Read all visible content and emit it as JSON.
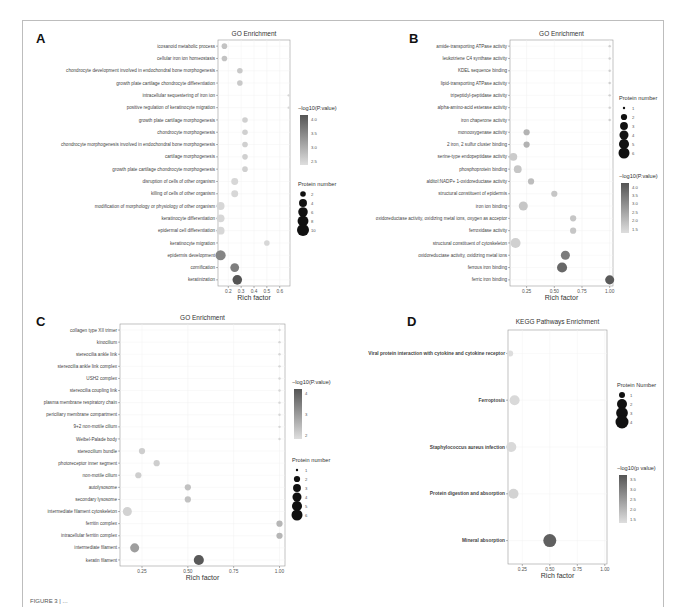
{
  "figure": {
    "caption_partial": "FIGURE 3 | ..."
  },
  "chart_data": [
    {
      "id": "A",
      "type": "scatter",
      "title": "GO Enrichment",
      "xlabel": "Rich factor",
      "ylabel": "",
      "xlim": [
        0.12,
        0.68
      ],
      "xticks": [
        0.2,
        0.3,
        0.4,
        0.5,
        0.6
      ],
      "xtick_labels": [
        "0.2",
        "0.3",
        "0.4",
        "0.5",
        "0.6"
      ],
      "grid": true,
      "legend_position": "right",
      "color_legend": {
        "title": "−log10(P.value)",
        "ticks": [
          "4.0",
          "3.5",
          "3.0",
          "2.5"
        ],
        "range": [
          2.2,
          4.2
        ]
      },
      "size_legend": {
        "title": "Protein number",
        "values": [
          2,
          4,
          6,
          8,
          10
        ]
      },
      "categories": [
        "icosanoid metabolic process",
        "cellular iron ion homeostasis",
        "chondrocyte development involved in endochondral bone morphogenesis",
        "growth plate cartilage chondrocyte differentiation",
        "intracellular sequestering of iron ion",
        "positive regulation of keratinocyte migration",
        "growth plate cartilage morphogenesis",
        "chondrocyte morphogenesis",
        "chondrocyte morphogenesis involved in endochondral bone morphogenesis",
        "cartilage morphogenesis",
        "growth plate cartilage chondrocyte morphogenesis",
        "disruption of cells of other organism",
        "killing of cells of other organism",
        "modification of morphology or physiology of other organism",
        "keratinocyte differentiation",
        "epidermal cell differentiation",
        "keratinocyte migration",
        "epidermis development",
        "cornification",
        "keratinization"
      ],
      "rich_factor": [
        0.17,
        0.17,
        0.29,
        0.29,
        0.67,
        0.67,
        0.33,
        0.33,
        0.33,
        0.33,
        0.33,
        0.25,
        0.25,
        0.14,
        0.14,
        0.14,
        0.5,
        0.14,
        0.25,
        0.27
      ],
      "protein_number": [
        2,
        2,
        2,
        2,
        1,
        1,
        2,
        2,
        2,
        2,
        2,
        3,
        3,
        4,
        4,
        4,
        2,
        7,
        5,
        6
      ],
      "neg_log10_p": [
        2.6,
        2.6,
        2.5,
        2.5,
        2.3,
        2.3,
        2.4,
        2.4,
        2.4,
        2.4,
        2.4,
        2.3,
        2.3,
        2.3,
        2.3,
        2.3,
        2.3,
        3.5,
        3.6,
        4.2
      ]
    },
    {
      "id": "B",
      "type": "scatter",
      "title": "GO Enrichment",
      "xlabel": "Rich factor",
      "ylabel": "",
      "xlim": [
        0.1,
        1.03
      ],
      "xticks": [
        0.25,
        0.5,
        0.75,
        1.0
      ],
      "xtick_labels": [
        "0.25",
        "0.50",
        "0.75",
        "1.00"
      ],
      "grid": true,
      "legend_position": "right",
      "size_legend": {
        "title": "Protein number",
        "values": [
          1,
          2,
          3,
          4,
          5,
          6
        ]
      },
      "color_legend": {
        "title": "−log10(P.value)",
        "ticks": [
          "4.0",
          "3.5",
          "3.0",
          "2.5",
          "2.0",
          "1.5"
        ],
        "range": [
          1.3,
          4.2
        ]
      },
      "categories": [
        "amide-transporting ATPase activity",
        "leukotriene C4 synthase activity",
        "KDEL sequence binding",
        "lipid-transporting ATPase activity",
        "tripeptidyl-peptidase activity",
        "alpha-amino-acid esterase activity",
        "iron chaperone activity",
        "monooxygenase activity",
        "2 iron, 2 sulfur cluster binding",
        "serine-type endopeptidase activity",
        "phosphoprotein binding",
        "alditol:NADP+ 1-oxidoreductase activity",
        "structural constituent of epidermis",
        "iron ion binding",
        "oxidoreductase activity, oxidizing metal ions, oxygen as acceptor",
        "ferroxidase activity",
        "structural constituent of cytoskeleton",
        "oxidoreductase activity, oxidizing metal ions",
        "ferrous iron binding",
        "ferric iron binding"
      ],
      "rich_factor": [
        1.0,
        1.0,
        1.0,
        1.0,
        1.0,
        1.0,
        1.0,
        0.25,
        0.25,
        0.13,
        0.17,
        0.29,
        0.5,
        0.22,
        0.67,
        0.67,
        0.15,
        0.6,
        0.57,
        1.0
      ],
      "protein_number": [
        1,
        1,
        1,
        1,
        1,
        1,
        1,
        2,
        2,
        3,
        3,
        2,
        2,
        4,
        2,
        2,
        5,
        4,
        5,
        4
      ],
      "neg_log10_p": [
        1.6,
        1.6,
        1.6,
        1.6,
        1.6,
        1.6,
        1.6,
        2.2,
        2.2,
        1.7,
        1.8,
        2.0,
        1.8,
        1.8,
        1.8,
        1.8,
        1.6,
        3.4,
        3.8,
        4.1
      ]
    },
    {
      "id": "C",
      "type": "scatter",
      "title": "GO Enrichment",
      "xlabel": "Rich factor",
      "ylabel": "",
      "xlim": [
        0.13,
        1.03
      ],
      "xticks": [
        0.25,
        0.5,
        0.75,
        1.0
      ],
      "xtick_labels": [
        "0.25",
        "0.50",
        "0.75",
        "1.00"
      ],
      "grid": true,
      "legend_position": "right",
      "color_legend": {
        "title": "−log10(P.value)",
        "ticks": [
          "4",
          "3",
          "2"
        ],
        "range": [
          1.6,
          5.0
        ]
      },
      "size_legend": {
        "title": "Protein number",
        "values": [
          1,
          2,
          3,
          4,
          5,
          6
        ]
      },
      "categories": [
        "collagen type XII trimer",
        "kinocilium",
        "stereocilia ankle link",
        "stereocilia ankle link complex",
        "USH2 complex",
        "stereocilia coupling link",
        "plasma membrane respiratory chain",
        "periciliary membrane compartment",
        "9+2 non-motile cilium",
        "Weibel-Palade body",
        "stereocilium bundle",
        "photoreceptor inner segment",
        "non-motile cilium",
        "autolysosome",
        "secondary lysosome",
        "intermediate filament cytoskeleton",
        "ferritin complex",
        "intracellular ferritin complex",
        "intermediate filament",
        "keratin filament"
      ],
      "rich_factor": [
        1.0,
        1.0,
        1.0,
        1.0,
        1.0,
        1.0,
        1.0,
        1.0,
        1.0,
        1.0,
        0.25,
        0.33,
        0.23,
        0.5,
        0.5,
        0.17,
        1.0,
        1.0,
        0.21,
        0.56
      ],
      "protein_number": [
        1,
        1,
        1,
        1,
        1,
        1,
        1,
        1,
        1,
        1,
        2,
        2,
        2,
        2,
        2,
        4,
        2,
        2,
        4,
        5
      ],
      "neg_log10_p": [
        1.8,
        1.8,
        1.8,
        1.8,
        1.8,
        1.8,
        1.8,
        1.8,
        1.8,
        1.8,
        2.0,
        2.0,
        2.0,
        2.3,
        2.3,
        1.9,
        2.6,
        2.6,
        3.2,
        4.9
      ]
    },
    {
      "id": "D",
      "type": "scatter",
      "title": "KEGG Pathways Enrichment",
      "xlabel": "Rich factor",
      "ylabel": "",
      "xlim": [
        0.12,
        1.02
      ],
      "xticks": [
        0.25,
        0.5,
        0.75,
        1.0
      ],
      "xtick_labels": [
        "0.25",
        "0.50",
        "0.75",
        "1.00"
      ],
      "grid": true,
      "legend_position": "right",
      "size_legend": {
        "title": "Protein Number",
        "values": [
          1,
          2,
          3,
          4
        ]
      },
      "color_legend": {
        "title": "−log10(p value)",
        "ticks": [
          "3.5",
          "3.0",
          "2.5",
          "2.0",
          "1.5"
        ],
        "range": [
          1.2,
          3.8
        ]
      },
      "categories": [
        "Viral protein interaction with cytokine and cytokine receptor",
        "Ferroptosis",
        "Staphylococcus aureus infection",
        "Protein digestion and absorption",
        "Mineral absorption"
      ],
      "rich_factor": [
        0.14,
        0.18,
        0.15,
        0.17,
        0.5
      ],
      "protein_number": [
        1,
        2,
        2,
        2,
        4
      ],
      "neg_log10_p": [
        1.2,
        1.3,
        1.3,
        1.4,
        3.6
      ]
    }
  ]
}
